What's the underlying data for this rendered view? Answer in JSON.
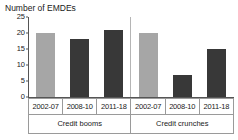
{
  "chart_data": {
    "type": "bar",
    "title": "Number of EMDEs",
    "xlabel": "",
    "ylabel": "",
    "ylim": [
      0,
      25
    ],
    "yticks": [
      0,
      5,
      10,
      15,
      20,
      25
    ],
    "grid": false,
    "legend": "none",
    "categories": [
      "2002-07",
      "2008-10",
      "2011-18",
      "2002-07",
      "2008-10",
      "2011-18"
    ],
    "groups": [
      {
        "label": "Credit booms",
        "categories": [
          "2002-07",
          "2008-10",
          "2011-18"
        ],
        "values": [
          20,
          18,
          21
        ]
      },
      {
        "label": "Credit crunches",
        "categories": [
          "2002-07",
          "2008-10",
          "2011-18"
        ],
        "values": [
          20,
          7,
          15
        ]
      }
    ],
    "values": [
      20,
      18,
      21,
      20,
      7,
      15
    ],
    "bar_colors": [
      "#a6a6a6",
      "#383838",
      "#383838",
      "#a6a6a6",
      "#383838",
      "#383838"
    ],
    "colors": {
      "light_bar": "#a6a6a6",
      "dark_bar": "#383838",
      "axis": "#555555",
      "text": "#1a1a1a",
      "table_border": "#9a9a9a",
      "background": "#ffffff"
    }
  }
}
